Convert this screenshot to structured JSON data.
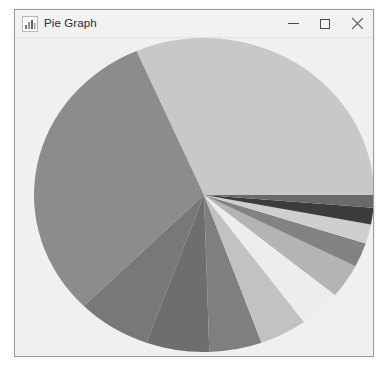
{
  "window": {
    "title": "Pie Graph",
    "icon": "chart-icon",
    "controls": {
      "minimize_label": "Minimize",
      "maximize_label": "Maximize",
      "close_label": "Close"
    }
  },
  "colors": {
    "window_background": "#f0f0f0",
    "titlebar_background": "#f2f2f2",
    "window_border": "#9a9a9a",
    "title_text": "#2b2b2b",
    "control_glyph": "#4a4a4a"
  },
  "chart_data": {
    "type": "pie",
    "title": "Pie Graph",
    "xlabel": "",
    "ylabel": "",
    "grid": false,
    "legend": "none",
    "start_angle_deg": 0,
    "direction": "counterclockwise",
    "center": {
      "x": 190,
      "y": 196
    },
    "radius": {
      "rx": 170,
      "ry": 157
    },
    "labels": [
      "Slice 1",
      "Slice 2",
      "Slice 3",
      "Slice 4",
      "Slice 5",
      "Slice 6",
      "Slice 7",
      "Slice 8",
      "Slice 9",
      "Slice 10",
      "Slice 11",
      "Slice 12"
    ],
    "values": [
      31.5,
      31.0,
      7.0,
      6.0,
      5.0,
      4.5,
      4.0,
      3.5,
      2.5,
      2.0,
      1.7,
      1.3
    ],
    "percentages": [
      31.5,
      31.0,
      7.0,
      6.0,
      5.0,
      4.5,
      4.0,
      3.5,
      2.5,
      2.0,
      1.7,
      1.3
    ],
    "slice_colors": [
      "#c8c8c8",
      "#8c8c8c",
      "#787878",
      "#6e6e6e",
      "#7f7f7f",
      "#c2c2c2",
      "#ededed",
      "#b4b4b4",
      "#828282",
      "#cfcfcf",
      "#3c3c3c",
      "#6a6a6a"
    ],
    "slice_angles_deg": [
      {
        "start": 0,
        "end": 113.4
      },
      {
        "start": 113.4,
        "end": 225.0
      },
      {
        "start": 225.0,
        "end": 250.2
      },
      {
        "start": 250.2,
        "end": 271.8
      },
      {
        "start": 271.8,
        "end": 289.8
      },
      {
        "start": 289.8,
        "end": 306.0
      },
      {
        "start": 306.0,
        "end": 320.4
      },
      {
        "start": 320.4,
        "end": 333.0
      },
      {
        "start": 333.0,
        "end": 342.0
      },
      {
        "start": 342.0,
        "end": 349.2
      },
      {
        "start": 349.2,
        "end": 355.3
      },
      {
        "start": 355.3,
        "end": 360.0
      }
    ]
  }
}
